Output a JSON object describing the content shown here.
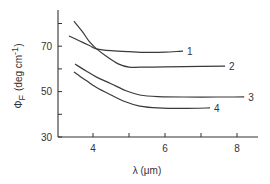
{
  "chart_data": {
    "type": "line",
    "title": "",
    "xlabel": "λ (μm)",
    "ylabel": "Φ_F (deg cm⁻¹)",
    "ylabel_main": "Φ",
    "ylabel_sub": "F",
    "ylabel_units": "(deg cm",
    "ylabel_exp": "-1",
    "ylabel_close": ")",
    "xlim": [
      3,
      8.6
    ],
    "ylim": [
      30,
      84
    ],
    "grid": false,
    "legend_position": "inline-curve-end",
    "x_ticks": [
      4,
      5,
      6,
      7,
      8
    ],
    "x_tick_labels": [
      "4",
      "",
      "6",
      "",
      "8"
    ],
    "y_ticks": [
      30,
      40,
      50,
      60,
      70,
      80
    ],
    "y_tick_labels": [
      "30",
      "",
      "50",
      "",
      "70",
      ""
    ],
    "series": [
      {
        "name": "1",
        "x": [
          3.33,
          3.6,
          3.9,
          4.1,
          4.5,
          5.0,
          5.5,
          6.0,
          6.5
        ],
        "y": [
          74.5,
          72.5,
          70.3,
          68.8,
          68.0,
          67.6,
          67.3,
          67.4,
          67.8
        ]
      },
      {
        "name": "2",
        "x": [
          3.47,
          3.7,
          3.9,
          4.1,
          4.4,
          4.7,
          5.0,
          5.5,
          6.0,
          7.0,
          7.67
        ],
        "y": [
          81.0,
          76.5,
          72.0,
          68.8,
          65.2,
          62.2,
          60.8,
          60.8,
          60.9,
          61.1,
          61.2
        ]
      },
      {
        "name": "3",
        "x": [
          3.5,
          3.8,
          4.1,
          4.5,
          4.9,
          5.3,
          5.8,
          6.5,
          7.5,
          8.2
        ],
        "y": [
          62.1,
          59.2,
          56.4,
          53.5,
          50.5,
          48.5,
          47.8,
          47.6,
          47.6,
          47.7
        ]
      },
      {
        "name": "4",
        "x": [
          3.47,
          3.8,
          4.1,
          4.5,
          4.9,
          5.3,
          5.8,
          6.5,
          7.25
        ],
        "y": [
          58.6,
          55.0,
          51.8,
          48.5,
          45.5,
          43.6,
          42.8,
          42.6,
          42.8
        ]
      }
    ]
  }
}
